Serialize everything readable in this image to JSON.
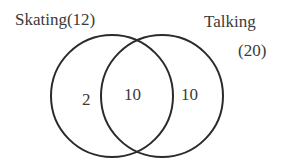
{
  "diagram": {
    "type": "venn",
    "sets": [
      {
        "name": "Skating",
        "label": "Skating(12)",
        "total": 12
      },
      {
        "name": "Talking",
        "label": "Talking",
        "total_label": "(20)",
        "total": 20
      }
    ],
    "regions": {
      "skating_only": "2",
      "both": "10",
      "talking_only": "10"
    },
    "colors": {
      "stroke": "#2b2b2b",
      "text": "#3a3a3a",
      "background": "#ffffff"
    }
  }
}
